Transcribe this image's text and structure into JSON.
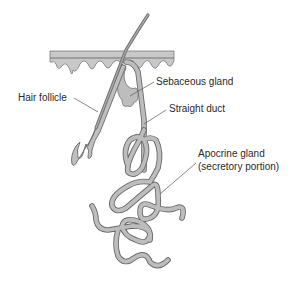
{
  "diagram": {
    "colors": {
      "background": "#ffffff",
      "tissue_fill": "#b8b8b8",
      "tissue_stroke": "#6a6a6a",
      "skin_fill": "#c4c4c4",
      "label_text": "#2a2a2a",
      "leader_line": "#555555"
    },
    "labels": {
      "sebaceous_gland": "Sebaceous gland",
      "hair_follicle": "Hair follicle",
      "straight_duct": "Straight duct",
      "apocrine_gland_line1": "Apocrine gland",
      "apocrine_gland_line2": "(secretory portion)"
    },
    "structures": [
      "skin-surface",
      "hair-shaft",
      "hair-follicle",
      "sebaceous-gland",
      "straight-duct",
      "apocrine-secretory-coil"
    ]
  }
}
